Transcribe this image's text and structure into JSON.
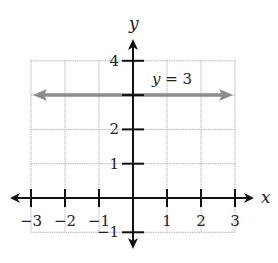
{
  "chart_data": {
    "type": "line",
    "title": "",
    "xlabel": "x",
    "ylabel": "y",
    "xlim": [
      -3,
      3
    ],
    "ylim": [
      -1,
      4
    ],
    "grid": true,
    "x_ticks": [
      -3,
      -2,
      -1,
      1,
      2,
      3
    ],
    "x_tick_labels": [
      "−3",
      "−2",
      "−1",
      "1",
      "2",
      "3"
    ],
    "y_ticks": [
      -1,
      1,
      2,
      4
    ],
    "y_tick_labels": [
      "−1",
      "1",
      "2",
      "4"
    ],
    "series": [
      {
        "name": "y = 3",
        "x": [
          -3,
          3
        ],
        "y": [
          3,
          3
        ],
        "color": "#8c8c8c",
        "arrows": "both"
      }
    ],
    "annotations": [
      {
        "text_var": "y",
        "text_rest": " = 3",
        "x": 1.6,
        "y": 3.4
      }
    ],
    "colors": {
      "axis": "#111111",
      "grid": "#b5b5b5",
      "line": "#8c8c8c"
    }
  }
}
